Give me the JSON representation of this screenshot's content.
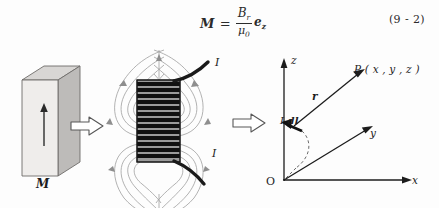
{
  "figure": {
    "caption_number": "(9 - 2)",
    "background_color": "#fdfdfd",
    "ink_color": "#1c1c1c"
  },
  "equation": {
    "lhs": "M",
    "equals": "=",
    "numerator": "B",
    "numerator_sub": "r",
    "denominator": "μ",
    "denominator_sub": "0",
    "unit_vector": "e",
    "unit_vector_sub": "z",
    "number": "(9 - 2)"
  },
  "panels": {
    "magnet": {
      "name": "permanent-magnet-block",
      "magnetization_label": "M",
      "face_color": "#eceae8",
      "top_color": "#d6d4d2",
      "side_color": "#b9b7b5",
      "edge_color": "#6e6c6a"
    },
    "solenoid": {
      "name": "current-carrying-solenoid",
      "current_label_top": "I",
      "current_label_bottom": "I",
      "coil_color": "#141414",
      "field_line_color": "#9a9a9a",
      "turns": 13
    },
    "coordinates": {
      "name": "coordinate-system",
      "origin_label": "O",
      "axis_x_label": "x",
      "axis_y_label": "y",
      "axis_z_label": "z",
      "point_label": "P ( x , y , z )",
      "vector_label": "r",
      "current_element_label_I": "I",
      "current_element_label_dl": "dl",
      "axis_color": "#1c1c1c",
      "dashed_color": "#6b6b6b"
    }
  },
  "transform_arrows": [
    {
      "name": "arrow-magnet-to-solenoid",
      "direction": "right"
    },
    {
      "name": "arrow-solenoid-to-coords",
      "direction": "right"
    }
  ]
}
